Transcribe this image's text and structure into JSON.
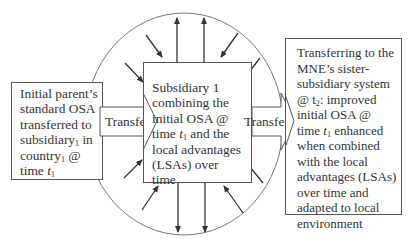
{
  "diagram": {
    "left_box": {
      "lines": [
        "Initial parent’s",
        "standard OSA",
        "transferred to",
        "subsidiary",
        "country",
        "time "
      ],
      "subscript": "1",
      "line4_suffix": " in",
      "line5_suffix": " @",
      "time_var": "t"
    },
    "center_box": {
      "lines": [
        "Subsidiary 1",
        "combining the",
        "initial OSA @",
        "time ",
        " and the",
        "local advantages",
        "(LSAs) over",
        "time"
      ],
      "time_var": "t",
      "subscript": "1"
    },
    "right_box": {
      "lines": [
        "Transferring to the",
        "MNE’s sister-",
        "subsidiary system",
        "@ t",
        ": improved",
        "initial OSA @",
        "time ",
        " enhanced",
        "when combined",
        "with the local",
        "advantages (LSAs)",
        "over time and",
        "adapted to local",
        "environment"
      ],
      "t2_sub": "2",
      "t1_sub": "1",
      "time_var": "t"
    },
    "arrows": {
      "left_transfer_label": "Transfer",
      "right_transfer_label": "Transfer"
    },
    "colors": {
      "line": "#555555",
      "text": "#333333",
      "background": "#ffffff"
    }
  }
}
